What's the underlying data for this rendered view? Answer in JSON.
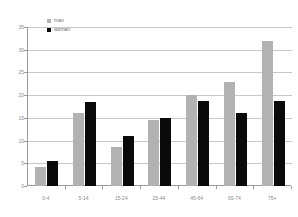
{
  "chart_data": {
    "type": "bar",
    "title": "",
    "xlabel": "",
    "ylabel": "",
    "categories": [
      "0-4",
      "5-14",
      "15-24",
      "25-44",
      "45-64",
      "65-74",
      "75+"
    ],
    "series": [
      {
        "name": "man",
        "color": "#b2b2b2",
        "values": [
          4.2,
          16.0,
          8.5,
          14.6,
          20.0,
          23.0,
          32.0
        ]
      },
      {
        "name": "woman",
        "color": "#0a0a0a",
        "values": [
          5.5,
          18.6,
          11.0,
          15.0,
          18.8,
          16.0,
          18.8
        ]
      }
    ],
    "ylim": [
      0,
      35
    ],
    "yticks": [
      0,
      5,
      10,
      15,
      20,
      25,
      30,
      35
    ],
    "ytick_labels": [
      "0",
      "5",
      "10",
      "15",
      "20",
      "25",
      "30",
      "35"
    ],
    "grid": true,
    "legend_position": "top-left"
  },
  "legend": {
    "entries": [
      {
        "label": "man"
      },
      {
        "label": "woman"
      }
    ]
  }
}
